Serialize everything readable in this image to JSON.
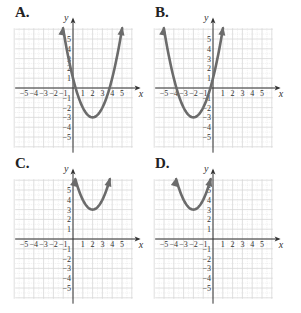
{
  "chart_data": [
    {
      "label": "A.",
      "type": "line",
      "title": "",
      "xlabel": "x",
      "ylabel": "y",
      "xlim": [
        -6,
        6
      ],
      "ylim": [
        -6,
        6
      ],
      "grid": true,
      "x_ticks": [
        "-5",
        "-4",
        "-3",
        "-2",
        "-1",
        "1",
        "2",
        "3",
        "4",
        "5"
      ],
      "y_ticks": [
        "5",
        "4",
        "3",
        "2",
        "1",
        "-1",
        "-2",
        "-3",
        "-4",
        "-5"
      ],
      "curve": "parabola",
      "vertex": [
        2,
        -3
      ],
      "equation": "y = (x-2)^2 - 3",
      "a": 1,
      "h": 2,
      "k": -3
    },
    {
      "label": "B.",
      "type": "line",
      "title": "",
      "xlabel": "x",
      "ylabel": "y",
      "xlim": [
        -6,
        6
      ],
      "ylim": [
        -6,
        6
      ],
      "grid": true,
      "x_ticks": [
        "-5",
        "-4",
        "-3",
        "-2",
        "-1",
        "1",
        "2",
        "3",
        "4",
        "5"
      ],
      "y_ticks": [
        "5",
        "4",
        "3",
        "2",
        "1",
        "-1",
        "-2",
        "-3",
        "-4",
        "-5"
      ],
      "curve": "parabola",
      "vertex": [
        -2,
        -3
      ],
      "equation": "y = (x+2)^2 - 3",
      "a": 1,
      "h": -2,
      "k": -3
    },
    {
      "label": "C.",
      "type": "line",
      "title": "",
      "xlabel": "x",
      "ylabel": "y",
      "xlim": [
        -6,
        6
      ],
      "ylim": [
        -6,
        6
      ],
      "grid": true,
      "x_ticks": [
        "-5",
        "-4",
        "-3",
        "-2",
        "-1",
        "1",
        "2",
        "3",
        "4",
        "5"
      ],
      "y_ticks": [
        "5",
        "4",
        "3",
        "2",
        "1",
        "-1",
        "-2",
        "-3",
        "-4",
        "-5"
      ],
      "curve": "parabola",
      "vertex": [
        2,
        3
      ],
      "equation": "y = (x-2)^2 + 3",
      "a": 1,
      "h": 2,
      "k": 3
    },
    {
      "label": "D.",
      "type": "line",
      "title": "",
      "xlabel": "x",
      "ylabel": "y",
      "xlim": [
        -6,
        6
      ],
      "ylim": [
        -6,
        6
      ],
      "grid": true,
      "x_ticks": [
        "-5",
        "-4",
        "-3",
        "-2",
        "-1",
        "1",
        "2",
        "3",
        "4",
        "5"
      ],
      "y_ticks": [
        "5",
        "4",
        "3",
        "2",
        "1",
        "-1",
        "-2",
        "-3",
        "-4",
        "-5"
      ],
      "curve": "parabola",
      "vertex": [
        -2,
        3
      ],
      "equation": "y = (x+2)^2 + 3",
      "a": 1,
      "h": -2,
      "k": 3
    }
  ],
  "colors": {
    "curve": "#6b6b6b",
    "grid": "#d8d8d8",
    "axis": "#333333",
    "text": "#333333"
  },
  "panels": [
    {
      "label": "A.",
      "left": 0,
      "top": 0,
      "origin_x": 73,
      "origin_y": 88
    },
    {
      "label": "B.",
      "left": 150,
      "top": 0,
      "origin_x": 63,
      "origin_y": 88
    },
    {
      "label": "C.",
      "left": 0,
      "top": 151,
      "origin_x": 73,
      "origin_y": 88
    },
    {
      "label": "D.",
      "left": 150,
      "top": 151,
      "origin_x": 63,
      "origin_y": 88
    }
  ]
}
